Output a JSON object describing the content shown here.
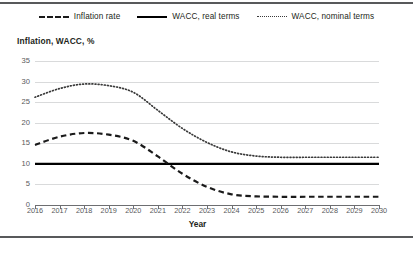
{
  "legend": {
    "position": "top-center",
    "items": [
      {
        "label": "Inflation rate",
        "key": "dashed-line-key",
        "style": "dashed"
      },
      {
        "label": "WACC, real terms",
        "key": "solid-line-key",
        "style": "solid"
      },
      {
        "label": "WACC, nominal terms",
        "key": "dotted-line-key",
        "style": "dotted"
      }
    ]
  },
  "axes": {
    "ytitle": "Inflation, WACC, %",
    "xtitle": "Year",
    "yticks": [
      "35",
      "30",
      "25",
      "20",
      "15",
      "10",
      "5",
      "0"
    ],
    "xticks": [
      "2016",
      "2017",
      "2018",
      "2019",
      "2020",
      "2021",
      "2022",
      "2023",
      "2024",
      "2025",
      "2026",
      "2027",
      "2028",
      "2029",
      "2030"
    ]
  },
  "colors": {
    "inflation": "#1a1a1a",
    "wacc_real": "#000000",
    "wacc_nominal": "#3a3a3a",
    "grid": "#d9dadb",
    "axis": "#6d6e71",
    "rule": "#58595b",
    "text": "#231f20",
    "tick_text": "#58595b"
  },
  "chart_data": {
    "type": "line",
    "title": "",
    "subtitle": "",
    "xlabel": "Year",
    "ylabel": "Inflation, WACC, %",
    "xlim": [
      2016,
      2030
    ],
    "ylim": [
      0,
      35
    ],
    "ytick_step": 5,
    "grid": true,
    "legend_position": "top-center",
    "x": [
      2016,
      2017,
      2018,
      2019,
      2020,
      2021,
      2022,
      2023,
      2024,
      2025,
      2026,
      2027,
      2028,
      2029,
      2030
    ],
    "series": [
      {
        "name": "Inflation rate",
        "style": "dashed",
        "color": "#1a1a1a",
        "values": [
          14.6,
          16.6,
          17.5,
          17.1,
          15.6,
          11.8,
          7.6,
          4.4,
          2.6,
          2.1,
          2.0,
          2.0,
          2.0,
          2.0,
          2.0
        ]
      },
      {
        "name": "WACC, real terms",
        "style": "solid",
        "color": "#000000",
        "values": [
          10.0,
          10.0,
          10.0,
          10.0,
          10.0,
          10.0,
          10.0,
          10.0,
          10.0,
          10.0,
          10.0,
          10.0,
          10.0,
          10.0,
          10.0
        ]
      },
      {
        "name": "WACC, nominal terms",
        "style": "dotted",
        "color": "#3a3a3a",
        "values": [
          26.2,
          28.3,
          29.4,
          29.0,
          27.4,
          23.0,
          18.6,
          15.2,
          12.9,
          11.9,
          11.6,
          11.6,
          11.6,
          11.6,
          11.6
        ]
      }
    ]
  }
}
